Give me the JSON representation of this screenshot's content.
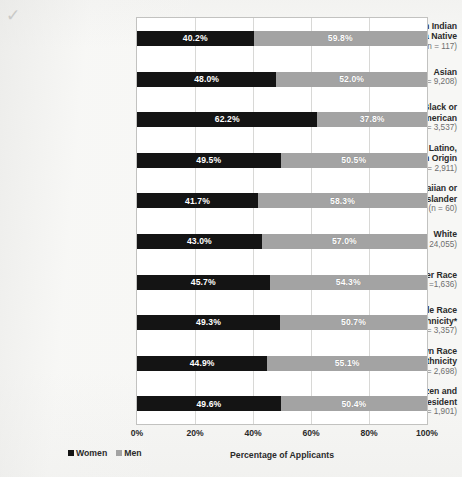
{
  "chart_data": {
    "type": "bar",
    "orientation": "horizontal",
    "stacked": true,
    "stacked_percent": true,
    "title": "",
    "xlabel": "Percentage of Applicants",
    "ylabel": "",
    "xlim": [
      0,
      100
    ],
    "xticks": [
      "0%",
      "20%",
      "40%",
      "60%",
      "80%",
      "100%"
    ],
    "xtick_values": [
      0,
      20,
      40,
      60,
      80,
      100
    ],
    "grid": true,
    "legend_position": "bottom-left",
    "categories": [
      "American Indian\nor Alaska Native",
      "Asian",
      "Black or\nAfrican-American",
      "Hispanic, Latino,\nor of Spanish Origin",
      "Native Hawaiian or\nOther Pacific Islander",
      "White",
      "Other Race",
      "Multiple Race\nand Ethnicity*",
      "Unknown Race\nand Ethnicity",
      "Non-U.S. Citizen and\nNon-Permanent Resident"
    ],
    "category_counts": [
      "(n = 117)",
      "(n = 9,208)",
      "(n = 3,537)",
      "(n = 2,911)",
      "(n = 60)",
      "(n = 24,055)",
      "(n =1,636)",
      "(n = 3,357)",
      "(n = 2,698)",
      "(n = 1,901)"
    ],
    "series": [
      {
        "name": "Women",
        "color": "#141414",
        "values": [
          40.2,
          48.0,
          62.2,
          49.5,
          41.7,
          43.0,
          45.7,
          49.3,
          44.9,
          49.6
        ],
        "labels": [
          "40.2%",
          "48.0%",
          "62.2%",
          "49.5%",
          "41.7%",
          "43.0%",
          "45.7%",
          "49.3%",
          "44.9%",
          "49.6%"
        ]
      },
      {
        "name": "Men",
        "color": "#a3a3a3",
        "values": [
          59.8,
          52.0,
          37.8,
          50.5,
          58.3,
          57.0,
          54.3,
          50.7,
          55.1,
          50.4
        ],
        "labels": [
          "59.8%",
          "52.0%",
          "37.8%",
          "50.5%",
          "58.3%",
          "57.0%",
          "54.3%",
          "50.7%",
          "55.1%",
          "50.4%"
        ]
      }
    ]
  },
  "legend": {
    "items": [
      {
        "label": "Women",
        "color": "#141414"
      },
      {
        "label": "Men",
        "color": "#a3a3a3"
      }
    ]
  },
  "axis": {
    "x_title": "Percentage of Applicants"
  },
  "artifact": {
    "scan_mark": "✓"
  }
}
